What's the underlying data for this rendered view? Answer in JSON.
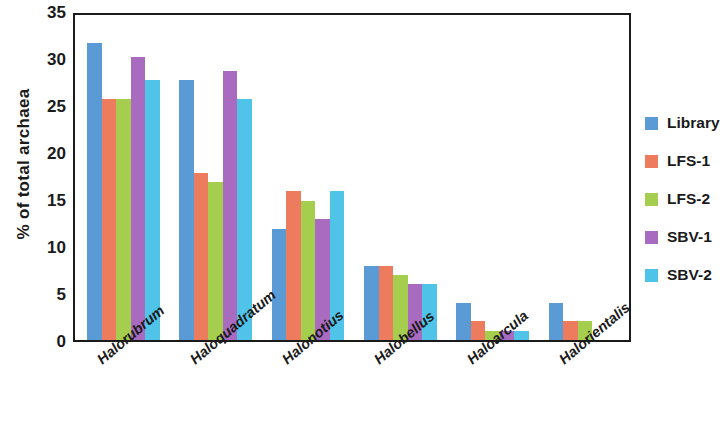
{
  "chart_data": {
    "type": "bar",
    "title": "",
    "xlabel": "",
    "ylabel": "% of total archaea",
    "ylim": [
      0,
      35
    ],
    "yticks": [
      0,
      5,
      10,
      15,
      20,
      25,
      30,
      35
    ],
    "grid": false,
    "legend_position": "right",
    "categories": [
      "Halorubrum",
      "Haloquadratum",
      "Halonotius",
      "Halobellus",
      "Haloarcula",
      "Halorientalis"
    ],
    "series": [
      {
        "name": "Library",
        "color": "#5B9BD5",
        "values": [
          32,
          28,
          12,
          8,
          4,
          4
        ]
      },
      {
        "name": "LFS-1",
        "color": "#ED7C5E",
        "values": [
          26,
          18,
          16,
          8,
          2,
          2
        ]
      },
      {
        "name": "LFS-2",
        "color": "#A6CE4E",
        "values": [
          26,
          17,
          15,
          7,
          1,
          2
        ]
      },
      {
        "name": "SBV-1",
        "color": "#A86BC0",
        "values": [
          30.5,
          29,
          13,
          6,
          1,
          0
        ]
      },
      {
        "name": "SBV-2",
        "color": "#4FC3E8",
        "values": [
          28,
          26,
          16,
          6,
          1,
          0
        ]
      }
    ]
  }
}
